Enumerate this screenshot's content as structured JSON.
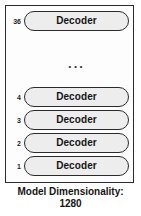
{
  "diagram": {
    "type": "transformer-decoder-stack",
    "frame": {
      "border_color": "#2b2b2b",
      "background_color": "#fdfdfd"
    },
    "pill": {
      "fill_color": "#ededed",
      "border_color": "#2b2b2b"
    },
    "layers": [
      {
        "index": "36",
        "label": "Decoder"
      },
      {
        "index": "4",
        "label": "Decoder"
      },
      {
        "index": "3",
        "label": "Decoder"
      },
      {
        "index": "2",
        "label": "Decoder"
      },
      {
        "index": "1",
        "label": "Decoder"
      }
    ],
    "ellipsis": "...",
    "caption": {
      "line1": "Model Dimensionality:",
      "line2": "1280"
    }
  }
}
